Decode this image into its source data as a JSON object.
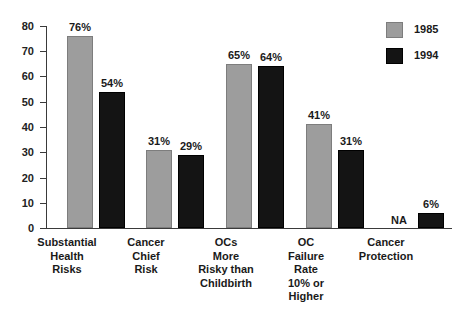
{
  "chart_data": {
    "type": "bar",
    "title": "",
    "subtitle": "",
    "xlabel": "",
    "ylabel": "",
    "ylim": [
      0,
      80
    ],
    "yticks": [
      0,
      10,
      20,
      30,
      40,
      50,
      60,
      70,
      80
    ],
    "ytick_labels": [
      "0",
      "10",
      "20",
      "30",
      "40",
      "50",
      "60",
      "70",
      "80"
    ],
    "grid": false,
    "legend_position": "top-right",
    "categories": [
      "Substantial Health Risks",
      "Cancer Chief Risk",
      "OCs More Risky than Childbirth",
      "OC Failure Rate 10% or Higher",
      "Cancer Protection"
    ],
    "category_lines": [
      [
        "Substantial",
        "Health",
        "Risks"
      ],
      [
        "Cancer",
        "Chief",
        "Risk"
      ],
      [
        "OCs",
        "More",
        "Risky than",
        "Childbirth"
      ],
      [
        "OC",
        "Failure",
        "Rate",
        "10% or",
        "Higher"
      ],
      [
        "Cancer",
        "Protection"
      ]
    ],
    "series": [
      {
        "name": "1985",
        "color": "#9d9d9d",
        "values": [
          76,
          31,
          65,
          41,
          null
        ],
        "labels": [
          "76%",
          "31%",
          "65%",
          "41%",
          "NA"
        ]
      },
      {
        "name": "1994",
        "color": "#141414",
        "values": [
          54,
          29,
          64,
          31,
          6
        ],
        "labels": [
          "54%",
          "29%",
          "64%",
          "31%",
          "6%"
        ]
      }
    ]
  },
  "legend": {
    "items": [
      {
        "label": "1985",
        "color": "#9d9d9d"
      },
      {
        "label": "1994",
        "color": "#141414"
      }
    ]
  },
  "axis": {
    "y_labels": [
      "80",
      "70",
      "60",
      "50",
      "40",
      "30",
      "20",
      "10",
      "0"
    ]
  }
}
